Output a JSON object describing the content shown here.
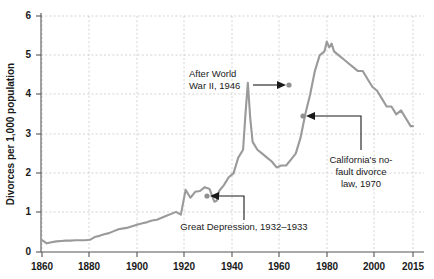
{
  "chart_data": {
    "type": "line",
    "title": "",
    "xlabel": "",
    "ylabel": "Divorces per 1,000 population",
    "xlim": [
      1860,
      2015
    ],
    "ylim": [
      0,
      6
    ],
    "grid": true,
    "legend": "none",
    "line_color": "#9a9a9a",
    "xticks": [
      1860,
      1880,
      1900,
      1920,
      1940,
      1960,
      1980,
      2000,
      2015
    ],
    "xtick_labels": [
      "1860",
      "1880",
      "1900",
      "1920",
      "1940",
      "1960",
      "1980",
      "2000",
      "2015"
    ],
    "yticks": [
      0,
      1,
      2,
      3,
      4,
      5,
      6
    ],
    "ytick_labels": [
      "0",
      "1",
      "2",
      "3",
      "4",
      "5",
      "6"
    ],
    "series": [
      {
        "name": "Divorce rate",
        "x": [
          1860,
          1862,
          1864,
          1866,
          1868,
          1870,
          1872,
          1874,
          1876,
          1878,
          1880,
          1882,
          1884,
          1886,
          1888,
          1890,
          1892,
          1894,
          1896,
          1898,
          1900,
          1902,
          1904,
          1906,
          1908,
          1910,
          1912,
          1914,
          1916,
          1918,
          1920,
          1922,
          1924,
          1926,
          1928,
          1930,
          1932,
          1933,
          1934,
          1936,
          1938,
          1940,
          1942,
          1944,
          1945,
          1946,
          1947,
          1948,
          1950,
          1952,
          1954,
          1956,
          1958,
          1960,
          1962,
          1964,
          1966,
          1968,
          1970,
          1972,
          1974,
          1976,
          1978,
          1979,
          1980,
          1981,
          1982,
          1984,
          1986,
          1988,
          1990,
          1992,
          1994,
          1996,
          1998,
          2000,
          2002,
          2004,
          2006,
          2008,
          2010,
          2012,
          2014,
          2015
        ],
        "values": [
          0.3,
          0.22,
          0.25,
          0.27,
          0.28,
          0.29,
          0.29,
          0.3,
          0.3,
          0.3,
          0.31,
          0.38,
          0.41,
          0.45,
          0.48,
          0.53,
          0.58,
          0.6,
          0.62,
          0.66,
          0.7,
          0.73,
          0.76,
          0.8,
          0.82,
          0.87,
          0.92,
          0.97,
          1.02,
          0.95,
          1.58,
          1.38,
          1.53,
          1.55,
          1.65,
          1.6,
          1.28,
          1.3,
          1.55,
          1.7,
          1.9,
          2.0,
          2.4,
          2.6,
          3.5,
          4.3,
          3.4,
          2.8,
          2.6,
          2.5,
          2.4,
          2.3,
          2.15,
          2.2,
          2.2,
          2.35,
          2.5,
          2.9,
          3.5,
          4.0,
          4.6,
          5.0,
          5.1,
          5.35,
          5.2,
          5.3,
          5.1,
          5.0,
          4.9,
          4.8,
          4.7,
          4.6,
          4.6,
          4.4,
          4.2,
          4.1,
          3.9,
          3.7,
          3.7,
          3.5,
          3.6,
          3.4,
          3.2,
          3.2
        ]
      }
    ],
    "annotations": [
      {
        "id": "wwii",
        "text_lines": [
          "After World",
          "War II, 1946"
        ],
        "point_year": 1946,
        "point_value": 4.3,
        "label_anchor": "end"
      },
      {
        "id": "california",
        "text_lines": [
          "California's no-",
          "fault divorce",
          "law, 1970"
        ],
        "point_year": 1970,
        "point_value": 3.5,
        "label_anchor": "middle"
      },
      {
        "id": "great-depression",
        "text_lines": [
          "Great Depression, 1932–1933"
        ],
        "point_year": 1933,
        "point_value": 1.3,
        "label_anchor": "middle"
      }
    ]
  }
}
